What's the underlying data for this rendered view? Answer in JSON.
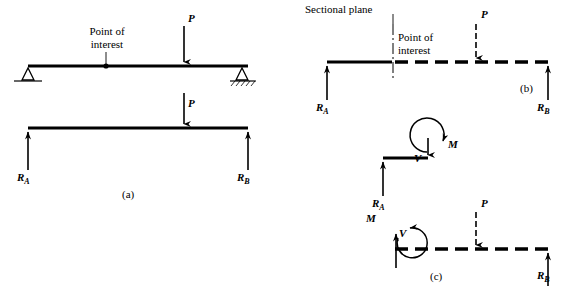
{
  "figure": {
    "title_parts": {
      "point_of_interest": "Point of\ninterest",
      "sectional_plane": "Sectional plane"
    },
    "labels": {
      "P": "P",
      "M": "M",
      "V": "V",
      "R": "R",
      "sub_A": "A",
      "sub_B": "B"
    },
    "captions": {
      "a": "(a)",
      "b": "(b)",
      "c": "(c)"
    },
    "colors": {
      "stroke": "#000000",
      "background": "#ffffff"
    }
  },
  "panel_a": {
    "caption": "(a)",
    "point_of_interest_label": "Point of\ninterest",
    "top_beam": {
      "load_label": "P",
      "support_left": "pin-support-triangle",
      "support_right": "roller-support-hatched"
    },
    "free_body": {
      "load_label": "P",
      "reaction_left": "R",
      "reaction_left_sub": "A",
      "reaction_right": "R",
      "reaction_right_sub": "B"
    }
  },
  "panel_b": {
    "caption": "(b)",
    "sectional_plane_label": "Sectional plane",
    "point_of_interest_label": "Point of\ninterest",
    "load_label": "P",
    "reaction_left": "R",
    "reaction_left_sub": "A",
    "reaction_right": "R",
    "reaction_right_sub": "B",
    "segment_free_body": {
      "moment_label": "M",
      "shear_label": "V",
      "reaction_left": "R",
      "reaction_left_sub": "A"
    }
  },
  "panel_c": {
    "caption": "(c)",
    "moment_label": "M",
    "shear_label": "V",
    "load_label": "P",
    "reaction_right": "R",
    "reaction_right_sub": "B"
  }
}
